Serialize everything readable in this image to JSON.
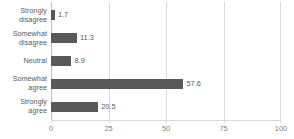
{
  "chart_data": {
    "type": "bar",
    "orientation": "horizontal",
    "title": "",
    "subtitle": "",
    "xlabel": "",
    "ylabel": "",
    "categories": [
      "Strongly disagree",
      "Somewhat disagree",
      "Neutral",
      "Somewhat agree",
      "Strongly agree"
    ],
    "category_lines": [
      [
        "Strongly",
        "disagree"
      ],
      [
        "Somewhat",
        "disagree"
      ],
      [
        "Neutral"
      ],
      [
        "Somewhat",
        "agree"
      ],
      [
        "Strongly",
        "agree"
      ]
    ],
    "values": [
      1.7,
      11.3,
      8.9,
      57.6,
      20.5
    ],
    "value_labels": [
      "1.7",
      "11.3",
      "8.9",
      "57.6",
      "20.5"
    ],
    "xlim": [
      0,
      100
    ],
    "ylim": null,
    "xticks": [
      0,
      25,
      50,
      75,
      100
    ],
    "xtick_labels": [
      "0",
      "25",
      "50",
      "75",
      "100"
    ],
    "grid": true,
    "grid_axis": "x",
    "legend": false,
    "legend_position": "none",
    "bar_color": "#595959",
    "grid_color": "#D9D9D9",
    "text_color": "#595959",
    "tick_text_color": "#808080",
    "background": "#FFFFFF",
    "data_labels_shown": true
  }
}
